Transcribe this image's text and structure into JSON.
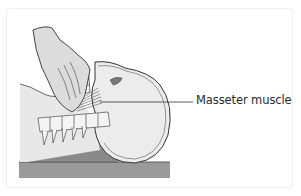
{
  "figure": {
    "labels": [
      {
        "text": "Masseter muscle",
        "target": "masseter-muscle"
      }
    ]
  },
  "colors": {
    "background": "#ffffff",
    "skin": "#e4e4e4",
    "outline": "#333333",
    "table": "#9a9a9a",
    "pillow": "#8a8a8a",
    "muscle": "#555555"
  }
}
